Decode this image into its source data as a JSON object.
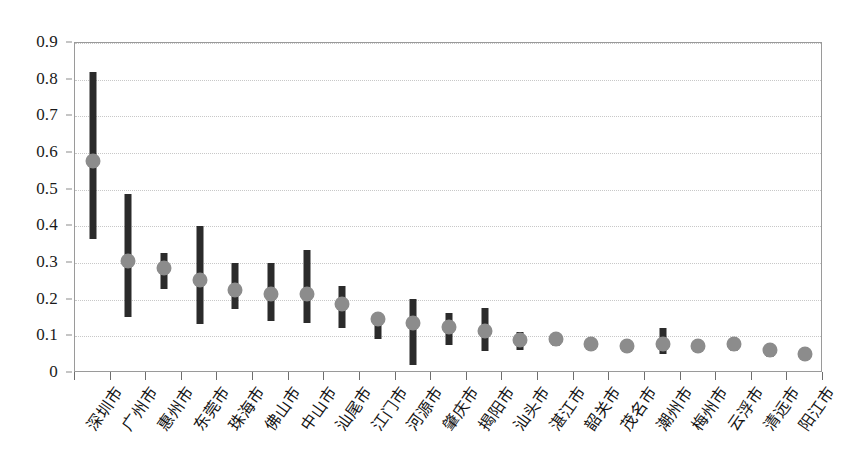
{
  "chart_data": {
    "type": "scatter",
    "title": "",
    "subtitle": "",
    "xlabel": "",
    "ylabel": "",
    "ylim": [
      0,
      0.9
    ],
    "y_ticks": [
      0,
      0.1,
      0.2,
      0.3,
      0.4,
      0.5,
      0.6,
      0.7,
      0.8,
      0.9
    ],
    "y_tick_labels": [
      "0",
      "0.1",
      "0.2",
      "0.3",
      "0.4",
      "0.5",
      "0.6",
      "0.7",
      "0.8",
      "0.9"
    ],
    "grid": true,
    "legend": "none",
    "marker_color": "#8c8c8c",
    "bar_color": "#2b2b2b",
    "categories": [
      "深圳市",
      "广州市",
      "惠州市",
      "东莞市",
      "珠海市",
      "佛山市",
      "中山市",
      "汕尾市",
      "江门市",
      "河源市",
      "肇庆市",
      "揭阳市",
      "汕头市",
      "湛江市",
      "韶关市",
      "茂名市",
      "潮州市",
      "梅州市",
      "云浮市",
      "清远市",
      "阳江市"
    ],
    "series": [
      {
        "name": "估计值",
        "values": [
          0.573,
          0.3,
          0.282,
          0.248,
          0.221,
          0.211,
          0.211,
          0.182,
          0.141,
          0.132,
          0.121,
          0.11,
          0.084,
          0.086,
          0.074,
          0.069,
          0.073,
          0.069,
          0.074,
          0.056,
          0.046
        ]
      },
      {
        "name": "置信区间下限",
        "values": [
          0.365,
          0.152,
          0.228,
          0.134,
          0.175,
          0.142,
          0.136,
          0.122,
          0.094,
          0.022,
          0.076,
          0.059,
          0.063,
          0.073,
          0.062,
          0.058,
          0.052,
          0.056,
          0.059,
          0.044,
          0.036
        ]
      },
      {
        "name": "置信区间上限",
        "values": [
          0.82,
          0.487,
          0.328,
          0.4,
          0.3,
          0.301,
          0.336,
          0.236,
          0.165,
          0.202,
          0.165,
          0.176,
          0.111,
          0.1,
          0.094,
          0.084,
          0.124,
          0.089,
          0.095,
          0.072,
          0.057
        ]
      }
    ]
  }
}
